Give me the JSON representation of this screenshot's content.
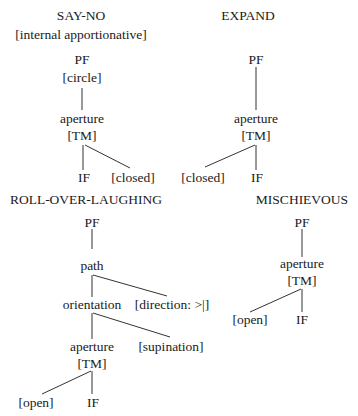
{
  "trees": {
    "say_no": {
      "title": "SAY-NO",
      "subtitle": "[internal apportionative]",
      "root": "PF",
      "root_feature": "[circle]",
      "node": "aperture",
      "node_feature": "[TM]",
      "left_leaf": "IF",
      "right_leaf": "[closed]"
    },
    "expand": {
      "title": "EXPAND",
      "root": "PF",
      "node": "aperture",
      "node_feature": "[TM]",
      "left_leaf": "[closed]",
      "right_leaf": "IF"
    },
    "roll_over_laughing": {
      "title": "ROLL-OVER-LAUGHING",
      "root": "PF",
      "path": "path",
      "path_feature": "[direction: >|]",
      "orientation": "orientation",
      "orientation_feature": "[supination]",
      "node": "aperture",
      "node_feature": "[TM]",
      "left_leaf": "[open]",
      "right_leaf": "IF"
    },
    "mischievous": {
      "title": "MISCHIEVOUS",
      "root": "PF",
      "node": "aperture",
      "node_feature": "[TM]",
      "left_leaf": "[open]",
      "right_leaf": "IF"
    }
  }
}
